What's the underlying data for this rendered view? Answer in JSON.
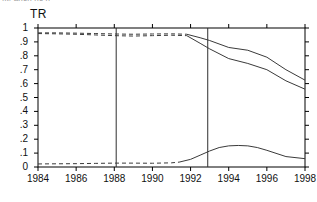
{
  "figure": {
    "clipped_header_text": "fit: anch  nc n",
    "series_label": "TR",
    "background_color": "#ffffff",
    "line_color": "#3a3a3a",
    "axis_color": "#000000"
  },
  "chart_data": {
    "type": "line",
    "title": "TR",
    "xlabel": "",
    "ylabel": "",
    "xlim": [
      1984,
      1998
    ],
    "ylim": [
      0,
      1
    ],
    "grid": false,
    "legend": "none",
    "xticks": [
      1984,
      1986,
      1988,
      1990,
      1992,
      1994,
      1996,
      1998
    ],
    "xtick_labels": [
      "1984",
      "1986",
      "1988",
      "1990",
      "1992",
      "1994",
      "1996",
      "1998"
    ],
    "yticks": [
      0,
      0.1,
      0.2,
      0.3,
      0.4,
      0.5,
      0.6,
      0.7,
      0.8,
      0.9,
      1
    ],
    "ytick_labels": [
      "0",
      ".1",
      ".2",
      ".3",
      ".4",
      ".5",
      ".6",
      ".7",
      ".8",
      ".9",
      "1"
    ],
    "vertical_reference_lines": [
      1988.1,
      1992.9
    ],
    "series": [
      {
        "name": "upper-band",
        "style": "dashed-then-solid",
        "dash_until_x": 1991.8,
        "x": [
          1984.0,
          1985.0,
          1986.0,
          1987.0,
          1988.0,
          1989.0,
          1990.0,
          1991.0,
          1991.8,
          1992.5,
          1993.0,
          1994.0,
          1995.0,
          1996.0,
          1997.0,
          1998.0
        ],
        "values": [
          0.965,
          0.965,
          0.963,
          0.96,
          0.957,
          0.955,
          0.957,
          0.958,
          0.955,
          0.93,
          0.91,
          0.86,
          0.84,
          0.79,
          0.7,
          0.625
        ]
      },
      {
        "name": "lower-band",
        "style": "dashed-then-solid",
        "dash_until_x": 1991.8,
        "x": [
          1984.0,
          1985.0,
          1986.0,
          1987.0,
          1988.0,
          1989.0,
          1990.0,
          1991.0,
          1991.8,
          1992.5,
          1993.0,
          1994.0,
          1995.0,
          1996.0,
          1997.0,
          1998.0
        ],
        "values": [
          0.96,
          0.958,
          0.955,
          0.95,
          0.945,
          0.942,
          0.945,
          0.948,
          0.945,
          0.89,
          0.85,
          0.78,
          0.745,
          0.7,
          0.62,
          0.56
        ]
      },
      {
        "name": "bottom-curve",
        "style": "dashed-then-solid",
        "dash_until_x": 1991.4,
        "x": [
          1984.0,
          1985.0,
          1986.0,
          1987.0,
          1988.0,
          1989.0,
          1990.0,
          1991.0,
          1991.4,
          1992.0,
          1992.5,
          1993.0,
          1993.5,
          1994.0,
          1994.5,
          1995.0,
          1995.5,
          1996.0,
          1997.0,
          1998.0
        ],
        "values": [
          0.022,
          0.023,
          0.024,
          0.026,
          0.028,
          0.028,
          0.027,
          0.03,
          0.035,
          0.055,
          0.085,
          0.115,
          0.14,
          0.152,
          0.155,
          0.152,
          0.14,
          0.12,
          0.075,
          0.06
        ]
      }
    ]
  }
}
